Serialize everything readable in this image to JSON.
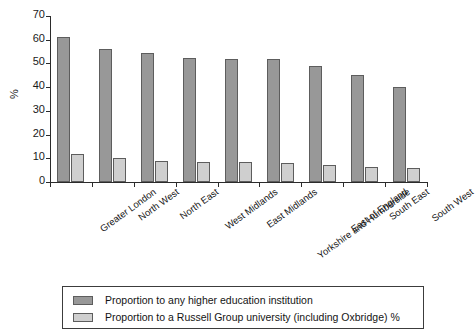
{
  "chart_data": {
    "type": "bar",
    "title": "",
    "xlabel": "",
    "ylabel": "%",
    "ylim": [
      0,
      70
    ],
    "ytick_step": 10,
    "yticks": [
      0,
      10,
      20,
      30,
      40,
      50,
      60,
      70
    ],
    "grid": false,
    "legend_position": "bottom",
    "categories": [
      "Greater London",
      "North West",
      "North East",
      "West Midlands",
      "East Midlands",
      "Yorkshire and Humberside",
      "East of England",
      "South East",
      "South West"
    ],
    "series": [
      {
        "name": "Proportion to any higher education institution",
        "color": "#989898",
        "values": [
          61,
          56,
          54.5,
          52.5,
          52,
          52,
          49,
          45,
          40
        ]
      },
      {
        "name": "Proportion to a Russell Group university (including Oxbridge) %",
        "color": "#cfcfcf",
        "values": [
          12,
          10,
          8.7,
          8.5,
          8.5,
          8,
          7,
          6.5,
          6
        ]
      }
    ]
  },
  "axis": {
    "y_title": "%"
  },
  "legend": {
    "items": [
      {
        "label": "Proportion to any higher education institution",
        "swatch": "dark"
      },
      {
        "label": "Proportion to a Russell Group university (including Oxbridge) %",
        "swatch": "light"
      }
    ]
  },
  "colors": {
    "series_dark": "#989898",
    "series_light": "#cfcfcf",
    "axis": "#2b2b2b",
    "bar_outline": "#5d5d5d",
    "background": "#ffffff"
  }
}
